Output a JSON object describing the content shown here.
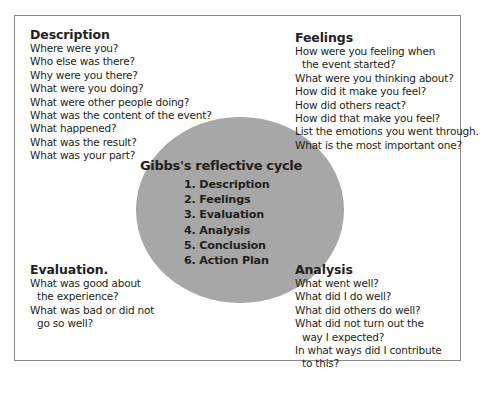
{
  "diagram": {
    "title": "Gibbs's reflective cycle",
    "stages": [
      "1. Description",
      "2. Feelings",
      "3. Evaluation",
      "4. Analysis",
      "5. Conclusion",
      "6. Action Plan"
    ],
    "colors": {
      "circle_fill": "#a7a7a7",
      "frame_border": "#8a8a8a",
      "text": "#231f20"
    }
  },
  "description": {
    "heading": "Description",
    "lines": [
      "Where were you?",
      "Who else was there?",
      "Why were you there?",
      "What were you doing?",
      "What were other people doing?",
      "What was the content of the event?",
      "What happened?",
      "What was the result?",
      "What was your part?"
    ]
  },
  "feelings": {
    "heading": "Feelings",
    "lines": [
      "How were you feeling when",
      "the event started?",
      "What were you thinking about?",
      "How did it make you feel?",
      "How did others react?",
      "How did that make you feel?",
      "List the emotions you went through.",
      "What is the most important one?"
    ]
  },
  "evaluation": {
    "heading": "Evaluation.",
    "lines": [
      "What was good about",
      "the experience?",
      "What was bad or did not",
      "go so well?"
    ]
  },
  "analysis": {
    "heading": "Analysis",
    "lines": [
      "What went well?",
      "What did I do well?",
      "What did others do well?",
      "What did not turn out the",
      "way I expected?",
      "In what ways did I contribute",
      "to this?"
    ]
  }
}
